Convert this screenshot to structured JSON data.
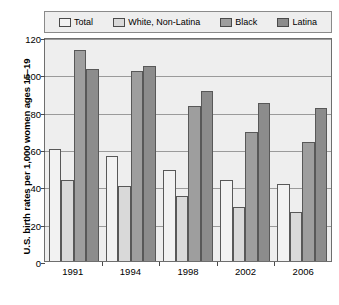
{
  "chart_data": {
    "type": "bar",
    "title": "",
    "subtitle": "",
    "xlabel": "",
    "ylabel": "U.S. birth rates per 1,000 women ages 15–19",
    "categories": [
      "1991",
      "1994",
      "1998",
      "2002",
      "2006"
    ],
    "ylim": [
      0,
      120
    ],
    "yticks": [
      0,
      20,
      40,
      60,
      80,
      100,
      120
    ],
    "ytick_labels": [
      "0",
      "20",
      "40",
      "60",
      "80",
      "100",
      "120"
    ],
    "grid": true,
    "legend_position": "top",
    "series": [
      {
        "name": "Total",
        "color": "#f2f2f2",
        "values": [
          59.9,
          56.3,
          48.5,
          43.5,
          41.5
        ]
      },
      {
        "name": "White, Non-Latina",
        "color": "#d9d9d9",
        "values": [
          43.4,
          40.2,
          35.0,
          29.0,
          26.5
        ]
      },
      {
        "name": "Black",
        "color": "#9e9e9e",
        "values": [
          113.0,
          102.0,
          83.0,
          69.0,
          63.5
        ]
      },
      {
        "name": "Latina",
        "color": "#8c8c8c",
        "values": [
          103.0,
          104.5,
          91.0,
          84.5,
          82.0
        ]
      }
    ],
    "plot_background": "#eeeeee",
    "axis_color": "#6e6e6e",
    "gridline_color": "#9a9a9a"
  }
}
